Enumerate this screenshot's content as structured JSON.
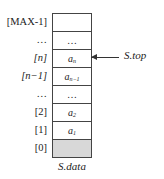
{
  "diagram": {
    "type": "sequential-stack",
    "caption": "S.data",
    "pointer_label": "S.top",
    "pointer_target_index": 2,
    "rows": [
      {
        "index_label": "[MAX-1]",
        "cell": "",
        "cell_sub": "",
        "shaded": false
      },
      {
        "index_label": "…",
        "cell": "…",
        "cell_sub": "",
        "shaded": false
      },
      {
        "index_label": "[n]",
        "cell": "a",
        "cell_sub": "n",
        "shaded": false
      },
      {
        "index_label": "[n−1]",
        "cell": "a",
        "cell_sub": "n−1",
        "shaded": false
      },
      {
        "index_label": "…",
        "cell": "…",
        "cell_sub": "",
        "shaded": false
      },
      {
        "index_label": "[2]",
        "cell": "a",
        "cell_sub": "2",
        "shaded": false
      },
      {
        "index_label": "[1]",
        "cell": "a",
        "cell_sub": "1",
        "shaded": false
      },
      {
        "index_label": "[0]",
        "cell": "",
        "cell_sub": "",
        "shaded": true
      }
    ],
    "colors": {
      "border": "#444444",
      "shaded_fill": "#d8d8d8",
      "text": "#222222"
    }
  }
}
